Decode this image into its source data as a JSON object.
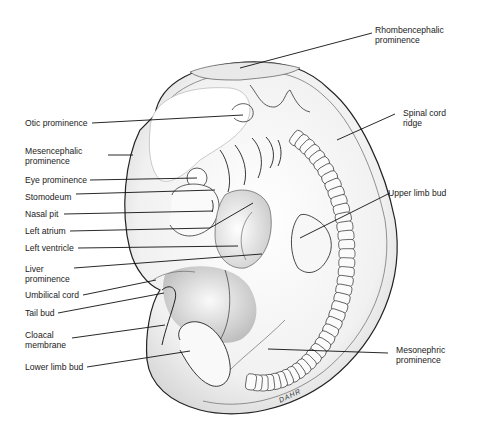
{
  "figure": {
    "signature": "DAHR",
    "labels": [
      {
        "id": "rhombencephalic",
        "text": "Rhombencephalic\nprominence",
        "side": "right"
      },
      {
        "id": "otic",
        "text": "Otic prominence",
        "side": "left"
      },
      {
        "id": "spinal-cord",
        "text": "Spinal cord\nridge",
        "side": "right"
      },
      {
        "id": "mesencephalic",
        "text": "Mesencephalic\nprominence",
        "side": "left"
      },
      {
        "id": "eye",
        "text": "Eye prominence",
        "side": "left"
      },
      {
        "id": "stomodeum",
        "text": "Stomodeum",
        "side": "left"
      },
      {
        "id": "upper-limb",
        "text": "Upper limb bud",
        "side": "right"
      },
      {
        "id": "nasal-pit",
        "text": "Nasal pit",
        "side": "left"
      },
      {
        "id": "left-atrium",
        "text": "Left atrium",
        "side": "left"
      },
      {
        "id": "left-ventricle",
        "text": "Left ventricle",
        "side": "left"
      },
      {
        "id": "liver",
        "text": "Liver\nprominence",
        "side": "left"
      },
      {
        "id": "umbilical",
        "text": "Umbilical cord",
        "side": "left"
      },
      {
        "id": "tail-bud",
        "text": "Tail bud",
        "side": "left"
      },
      {
        "id": "cloacal",
        "text": "Cloacal\nmembrane",
        "side": "left"
      },
      {
        "id": "mesonephric",
        "text": "Mesonephric\nprominence",
        "side": "right"
      },
      {
        "id": "lower-limb",
        "text": "Lower limb bud",
        "side": "left"
      }
    ]
  }
}
